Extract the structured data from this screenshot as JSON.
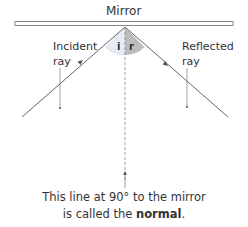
{
  "title": "Mirror",
  "labels": {
    "incident_line1": "Incident",
    "incident_line2": "ray",
    "reflected_line1": "Reflected",
    "reflected_line2": "ray",
    "angle_i": "i",
    "angle_r": "r"
  },
  "caption": {
    "line1": "This line at 90° to the mirror",
    "line2_prefix": "is called the ",
    "line2_bold": "normal",
    "line2_suffix": "."
  },
  "colors": {
    "line": "#666666",
    "angle_i_fill": "#e6ecf5",
    "angle_r_fill": "#bdbdbd",
    "mirror_stroke": "#8a8a8a",
    "text": "#333333"
  }
}
